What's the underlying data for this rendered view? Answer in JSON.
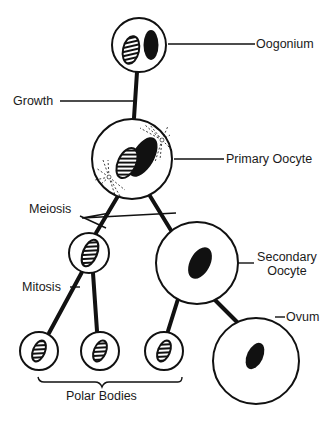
{
  "diagram": {
    "labels": {
      "oogonium": "Oogonium",
      "growth": "Growth",
      "primary_oocyte": "Primary Oocyte",
      "meiosis": "Meiosis",
      "secondary_oocyte_line1": "Secondary",
      "secondary_oocyte_line2": "Oocyte",
      "mitosis": "Mitosis",
      "ovum": "Ovum",
      "polar_bodies": "Polar Bodies"
    },
    "colors": {
      "line": "#111111",
      "fill": "#ffffff",
      "text": "#1a1a1a"
    }
  }
}
